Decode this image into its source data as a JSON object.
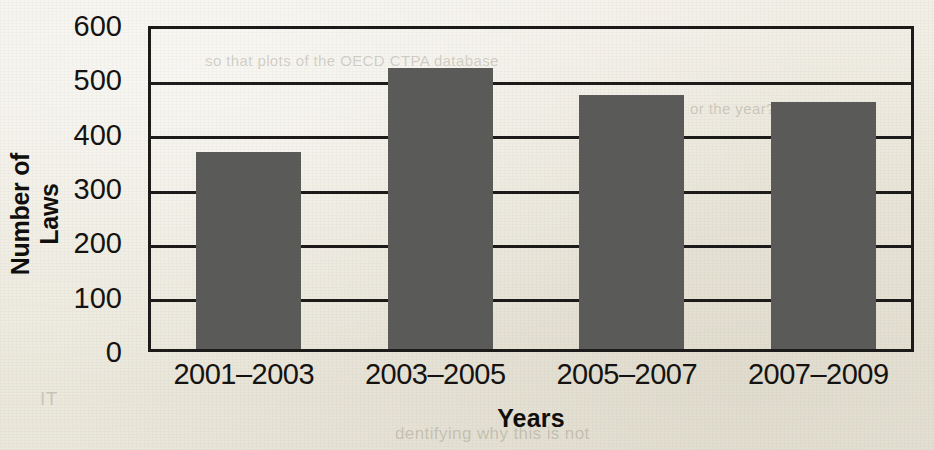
{
  "chart_data": {
    "type": "bar",
    "title": "",
    "xlabel": "Years",
    "ylabel": "Number of Laws",
    "categories": [
      "2001–2003",
      "2003–2005",
      "2005–2007",
      "2007–2009"
    ],
    "values": [
      368,
      523,
      473,
      460
    ],
    "ylim": [
      0,
      600
    ],
    "ytick_values": [
      0,
      100,
      200,
      300,
      400,
      500,
      600
    ],
    "ytick_labels": [
      "0",
      "100",
      "200",
      "300",
      "400",
      "500",
      "600"
    ],
    "grid": true,
    "grid_axis": "y",
    "legend": null,
    "bar_color": "#5a5a58",
    "axis_color": "#1d1b19",
    "background_color": "#efece3"
  },
  "background_text": [
    {
      "text": "so that plots of the OECD CTPA database",
      "x": 205,
      "y": 52,
      "size": 15
    },
    {
      "text": "or the year?",
      "x": 690,
      "y": 100,
      "size": 15
    },
    {
      "text": "IT",
      "x": 40,
      "y": 388,
      "size": 19
    },
    {
      "text": "dentifying why this is not",
      "x": 395,
      "y": 424,
      "size": 17
    }
  ]
}
